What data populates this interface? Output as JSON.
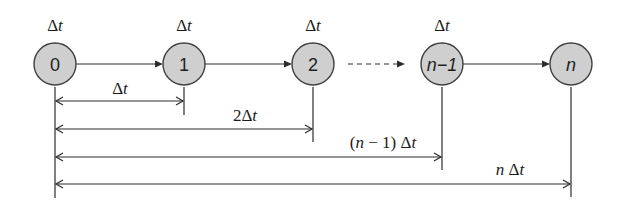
{
  "diagram": {
    "colors": {
      "node_fill": "#cfcfcf",
      "node_stroke": "#3f3f3f",
      "line": "#2c2c2c",
      "text": "#1a1a1a"
    },
    "nodes": [
      {
        "id": "0",
        "label": "0",
        "top_label": "Δt",
        "italic": false
      },
      {
        "id": "1",
        "label": "1",
        "top_label": "Δt",
        "italic": false
      },
      {
        "id": "2",
        "label": "2",
        "top_label": "Δt",
        "italic": false
      },
      {
        "id": "n-1",
        "label": "n−1",
        "top_label": "Δt",
        "italic": true
      },
      {
        "id": "n",
        "label": "n",
        "top_label": "",
        "italic": true
      }
    ],
    "edges": [
      {
        "from": "0",
        "to": "1",
        "style": "solid"
      },
      {
        "from": "1",
        "to": "2",
        "style": "solid"
      },
      {
        "from": "2",
        "to": "n-1",
        "style": "dashed"
      },
      {
        "from": "n-1",
        "to": "n",
        "style": "solid"
      }
    ],
    "top_labels": {
      "delta": "Δ",
      "t": "t"
    },
    "dimensions": [
      {
        "from": "0",
        "to": "1",
        "label_prefix": "",
        "label_delta": "Δ",
        "label_t": "t",
        "coef": ""
      },
      {
        "from": "0",
        "to": "2",
        "label_prefix": "",
        "label_delta": "Δ",
        "label_t": "t",
        "coef": "2"
      },
      {
        "from": "0",
        "to": "n-1",
        "label_prefix": "(n − 1) ",
        "label_delta": "Δ",
        "label_t": "t",
        "coef": ""
      },
      {
        "from": "0",
        "to": "n",
        "label_prefix": "n ",
        "label_delta": "Δ",
        "label_t": "t",
        "coef": ""
      }
    ],
    "dim_labels": {
      "d1_delta": "Δ",
      "d1_t": "t",
      "d2_coef": "2",
      "d2_delta": "Δ",
      "d2_t": "t",
      "d3_open": "(",
      "d3_n": "n",
      "d3_rest": " − 1) ",
      "d3_delta": "Δ",
      "d3_t": "t",
      "d4_n": "n",
      "d4_space": " ",
      "d4_delta": "Δ",
      "d4_t": "t"
    }
  }
}
